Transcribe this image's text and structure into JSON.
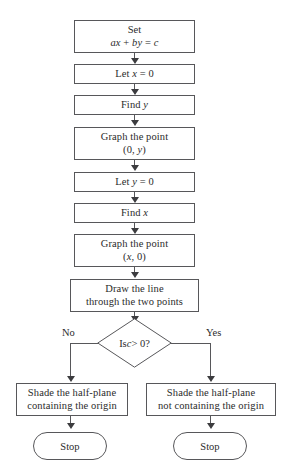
{
  "diagram": {
    "stroke_color": "#57575a",
    "text_color": "#2b2b2b",
    "background": "#ffffff",
    "nodes": [
      {
        "id": "set",
        "type": "process",
        "line1": "Set",
        "line2_prefix": "",
        "equation": "ax + by = c"
      },
      {
        "id": "let-x-zero",
        "type": "process",
        "line1": "Let x = 0"
      },
      {
        "id": "find-y",
        "type": "process",
        "line1": "Find y"
      },
      {
        "id": "graph-point-0y",
        "type": "process",
        "line1": "Graph the point",
        "line2": "(0, y)"
      },
      {
        "id": "let-y-zero",
        "type": "process",
        "line1": "Let y = 0"
      },
      {
        "id": "find-x",
        "type": "process",
        "line1": "Find x"
      },
      {
        "id": "graph-point-x0",
        "type": "process",
        "line1": "Graph the point",
        "line2": "(x, 0)"
      },
      {
        "id": "draw-line",
        "type": "process",
        "line1": "Draw the line",
        "line2": "through the two points"
      },
      {
        "id": "decision",
        "type": "decision",
        "line1": "Is c > 0?"
      },
      {
        "id": "shade-containing",
        "type": "process",
        "line1": "Shade the half-plane",
        "line2": "containing the origin"
      },
      {
        "id": "shade-not-containing",
        "type": "process",
        "line1": "Shade the half-plane",
        "line2": "not containing the origin"
      },
      {
        "id": "stop-left",
        "type": "terminator",
        "line1": "Stop"
      },
      {
        "id": "stop-right",
        "type": "terminator",
        "line1": "Stop"
      }
    ],
    "branches": {
      "no_label": "No",
      "yes_label": "Yes"
    }
  },
  "box_set": {
    "line1": "Set",
    "eq_a": "a",
    "eq_x": "x",
    "eq_plus": " + ",
    "eq_b": "b",
    "eq_y": "y",
    "eq_equals": " = ",
    "eq_c": "c"
  },
  "box_let_x": {
    "pre": "Let ",
    "var": "x",
    "post": " = 0"
  },
  "box_find_y": {
    "pre": "Find ",
    "var": "y"
  },
  "box_graph_0y": {
    "line1": "Graph the point",
    "open": "(0, ",
    "var": "y",
    "close": ")"
  },
  "box_let_y": {
    "pre": "Let ",
    "var": "y",
    "post": " = 0"
  },
  "box_find_x": {
    "pre": "Find ",
    "var": "x"
  },
  "box_graph_x0": {
    "line1": "Graph the point",
    "open": "(",
    "var": "x",
    "close": ", 0)"
  },
  "box_draw_line": {
    "line1": "Draw the line",
    "line2": "through the two points"
  },
  "decision": {
    "pre": "Is ",
    "var": "c",
    "post": " > 0?",
    "no_label": "No",
    "yes_label": "Yes"
  },
  "box_shade_left": {
    "line1": "Shade the half-plane",
    "line2": "containing the origin"
  },
  "box_shade_right": {
    "line1": "Shade the half-plane",
    "line2": "not containing the origin"
  },
  "stop_left": {
    "label": "Stop"
  },
  "stop_right": {
    "label": "Stop"
  }
}
